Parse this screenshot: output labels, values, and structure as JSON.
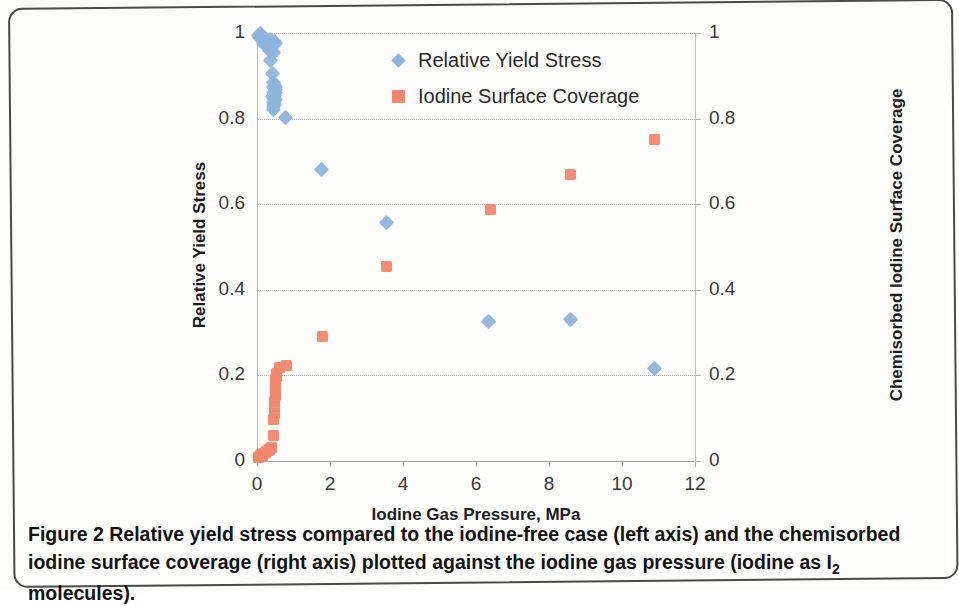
{
  "figure": {
    "caption_prefix": "Figure 2",
    "caption_text": " Relative yield stress compared to the iodine-free case (left axis) and the chemisorbed iodine surface coverage (right axis) plotted against the iodine gas pressure (iodine as I",
    "caption_sub": "2",
    "caption_suffix": " molecules)."
  },
  "legend": {
    "items": [
      {
        "label": "Relative Yield Stress",
        "marker": "diamond",
        "color": "#8FB4DC"
      },
      {
        "label": "Iodine Surface Coverage",
        "marker": "square",
        "color": "#F2866A"
      }
    ]
  },
  "chart_data": {
    "type": "scatter",
    "title": "",
    "xlabel": "Iodine Gas Pressure, MPa",
    "ylabel": "Relative Yield Stress",
    "y2label": "Chemisorbed Iodine Surface Coverage",
    "xlim": [
      0,
      12
    ],
    "ylim": [
      0,
      1
    ],
    "y2lim": [
      0,
      1
    ],
    "xticks": [
      0,
      2,
      4,
      6,
      8,
      10,
      12
    ],
    "xticklabels": [
      "0",
      "2",
      "4",
      "6",
      "8",
      "10",
      "12"
    ],
    "yticks": [
      0,
      0.2,
      0.4,
      0.6,
      0.8,
      1
    ],
    "yticklabels": [
      "0",
      "0.2",
      "0.4",
      "0.6",
      "0.8",
      "1"
    ],
    "y2ticks": [
      0,
      0.2,
      0.4,
      0.6,
      0.8,
      1
    ],
    "y2ticklabels": [
      "0",
      "0.2",
      "0.4",
      "0.6",
      "0.8",
      "1"
    ],
    "grid": true,
    "legend_position": "upper center",
    "series": [
      {
        "name": "Relative Yield Stress",
        "axis": "left",
        "marker": "diamond",
        "color": "#8FB4DC",
        "points": [
          [
            0.05,
            0.995
          ],
          [
            0.08,
            0.99
          ],
          [
            0.1,
            1.0
          ],
          [
            0.12,
            0.985
          ],
          [
            0.15,
            0.99
          ],
          [
            0.18,
            0.975
          ],
          [
            0.22,
            0.985
          ],
          [
            0.26,
            0.97
          ],
          [
            0.3,
            0.975
          ],
          [
            0.33,
            0.96
          ],
          [
            0.36,
            0.985
          ],
          [
            0.4,
            0.975
          ],
          [
            0.44,
            0.955
          ],
          [
            0.38,
            0.935
          ],
          [
            0.48,
            0.98
          ],
          [
            0.52,
            0.975
          ],
          [
            0.42,
            0.905
          ],
          [
            0.45,
            0.885
          ],
          [
            0.47,
            0.878
          ],
          [
            0.44,
            0.872
          ],
          [
            0.5,
            0.875
          ],
          [
            0.52,
            0.868
          ],
          [
            0.46,
            0.862
          ],
          [
            0.49,
            0.855
          ],
          [
            0.43,
            0.852
          ],
          [
            0.47,
            0.845
          ],
          [
            0.51,
            0.862
          ],
          [
            0.45,
            0.838
          ],
          [
            0.48,
            0.832
          ],
          [
            0.44,
            0.828
          ],
          [
            0.5,
            0.845
          ],
          [
            0.46,
            0.822
          ],
          [
            0.78,
            0.802
          ],
          [
            1.78,
            0.68
          ],
          [
            3.55,
            0.558
          ],
          [
            6.35,
            0.327
          ],
          [
            8.6,
            0.33
          ],
          [
            10.9,
            0.216
          ]
        ]
      },
      {
        "name": "Iodine Surface Coverage",
        "axis": "right",
        "marker": "square",
        "color": "#F2866A",
        "points": [
          [
            0.04,
            0.008
          ],
          [
            0.07,
            0.01
          ],
          [
            0.1,
            0.012
          ],
          [
            0.13,
            0.015
          ],
          [
            0.16,
            0.013
          ],
          [
            0.19,
            0.018
          ],
          [
            0.23,
            0.02
          ],
          [
            0.27,
            0.022
          ],
          [
            0.31,
            0.025
          ],
          [
            0.35,
            0.028
          ],
          [
            0.38,
            0.03
          ],
          [
            0.41,
            0.032
          ],
          [
            0.44,
            0.06
          ],
          [
            0.46,
            0.098
          ],
          [
            0.47,
            0.112
          ],
          [
            0.48,
            0.128
          ],
          [
            0.49,
            0.14
          ],
          [
            0.5,
            0.152
          ],
          [
            0.5,
            0.163
          ],
          [
            0.51,
            0.172
          ],
          [
            0.51,
            0.182
          ],
          [
            0.52,
            0.19
          ],
          [
            0.53,
            0.198
          ],
          [
            0.54,
            0.205
          ],
          [
            0.62,
            0.218
          ],
          [
            0.8,
            0.224
          ],
          [
            1.8,
            0.29
          ],
          [
            3.55,
            0.455
          ],
          [
            6.4,
            0.588
          ],
          [
            8.6,
            0.67
          ],
          [
            10.9,
            0.752
          ]
        ]
      }
    ]
  }
}
